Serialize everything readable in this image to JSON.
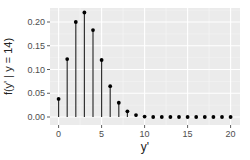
{
  "chart_data": {
    "type": "lollipop",
    "title": "",
    "xlabel": "y'",
    "ylabel": "f(y' | y = 14)",
    "x": [
      0,
      1,
      2,
      3,
      4,
      5,
      6,
      7,
      8,
      9,
      10,
      11,
      12,
      13,
      14,
      15,
      16,
      17,
      18,
      19,
      20
    ],
    "values": [
      0.038,
      0.122,
      0.2,
      0.22,
      0.183,
      0.12,
      0.065,
      0.03,
      0.012,
      0.004,
      0.001,
      0.0,
      0.0,
      0.0,
      0.0,
      0.0,
      0.0,
      0.0,
      0.0,
      0.0,
      0.0
    ],
    "xlim": [
      0,
      20
    ],
    "ylim": [
      0,
      0.22
    ],
    "xticks": [
      0,
      5,
      10,
      15,
      20
    ],
    "xtick_labels": [
      "0",
      "5",
      "10",
      "15",
      "20"
    ],
    "yticks": [
      0.0,
      0.05,
      0.1,
      0.15,
      0.2
    ],
    "ytick_labels": [
      "0.00",
      "0.05",
      "0.10",
      "0.15",
      "0.20"
    ],
    "grid": true,
    "legend": null,
    "colors": {
      "panel": "#ebebeb",
      "grid_major": "#ffffff",
      "stem": "#333333",
      "point": "#000000"
    }
  }
}
